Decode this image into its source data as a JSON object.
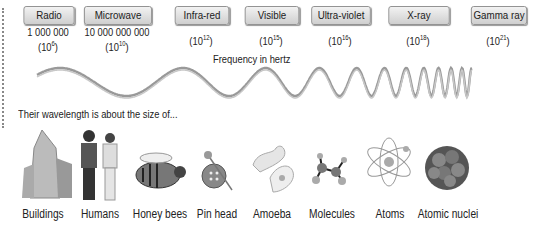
{
  "bands": [
    {
      "name": "Radio",
      "value": "1 000 000",
      "exp": "6"
    },
    {
      "name": "Microwave",
      "value": "10 000 000 000",
      "exp": "10"
    },
    {
      "name": "Infra-red",
      "value": "",
      "exp": "12"
    },
    {
      "name": "Visible",
      "value": "",
      "exp": "15"
    },
    {
      "name": "Ultra-violet",
      "value": "",
      "exp": "16"
    },
    {
      "name": "X-ray",
      "value": "",
      "exp": "18"
    },
    {
      "name": "Gamma ray",
      "value": "",
      "exp": "21"
    }
  ],
  "frequency_label": "Frequency in hertz",
  "wavelength_caption": "Their wavelength is about the size of...",
  "objects": [
    "Buildings",
    "Humans",
    "Honey bees",
    "Pin head",
    "Amoeba",
    "Molecules",
    "Atoms",
    "Atomic nuclei"
  ]
}
